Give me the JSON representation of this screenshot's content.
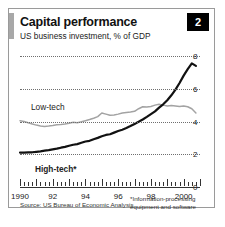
{
  "card": {
    "badge_number": "2",
    "title": "Capital performance",
    "subtitle": "US business investment, % of GDP",
    "source": "Source: US Bureau of Economic Analysis",
    "footnote_line1": "*Information-processing",
    "footnote_line2": "equipment and software"
  },
  "colors": {
    "high_tech": "#111111",
    "low_tech": "#a3a3a3",
    "grid": "#6f6f6f",
    "axis": "#333333",
    "badge_bg": "#000000",
    "accent_bar": "#a8a8a8"
  },
  "chart_data": {
    "type": "line",
    "title": "Capital performance",
    "subtitle": "US business investment, % of GDP",
    "xlabel": "",
    "ylabel": "% of GDP",
    "xlim": [
      1990,
      2001
    ],
    "ylim": [
      0,
      8
    ],
    "yticks": [
      0,
      2,
      4,
      6,
      8
    ],
    "xticks": [
      1990,
      1992,
      1994,
      1996,
      1998,
      2000
    ],
    "xticklabels": [
      "1990",
      "92",
      "94",
      "96",
      "98",
      "2000"
    ],
    "grid": "horizontal-dotted",
    "legend": "inline-labels",
    "x": [
      1990,
      1990.25,
      1990.5,
      1990.75,
      1991,
      1991.25,
      1991.5,
      1991.75,
      1992,
      1992.25,
      1992.5,
      1992.75,
      1993,
      1993.25,
      1993.5,
      1993.75,
      1994,
      1994.25,
      1994.5,
      1994.75,
      1995,
      1995.25,
      1995.5,
      1995.75,
      1996,
      1996.25,
      1996.5,
      1996.75,
      1997,
      1997.25,
      1997.5,
      1997.75,
      1998,
      1998.25,
      1998.5,
      1998.75,
      1999,
      1999.25,
      1999.5,
      1999.75,
      2000,
      2000.25,
      2000.5,
      2000.75
    ],
    "series": [
      {
        "name": "High-tech*",
        "label": "High-tech*",
        "color": "#111111",
        "note": "Information-processing equipment and software",
        "values": [
          2.1,
          2.1,
          2.12,
          2.12,
          2.15,
          2.18,
          2.22,
          2.25,
          2.3,
          2.34,
          2.4,
          2.45,
          2.52,
          2.58,
          2.62,
          2.7,
          2.78,
          2.82,
          2.92,
          3.0,
          3.1,
          3.18,
          3.22,
          3.32,
          3.42,
          3.5,
          3.6,
          3.72,
          3.85,
          3.98,
          4.12,
          4.28,
          4.45,
          4.62,
          4.85,
          5.05,
          5.3,
          5.6,
          5.95,
          6.35,
          6.8,
          7.2,
          7.55,
          7.4
        ]
      },
      {
        "name": "Low-tech",
        "label": "Low-tech",
        "color": "#a3a3a3",
        "values": [
          4.05,
          4.0,
          3.92,
          3.85,
          3.78,
          3.72,
          3.7,
          3.72,
          3.75,
          3.8,
          3.82,
          3.85,
          3.9,
          3.95,
          3.92,
          3.98,
          4.05,
          4.12,
          4.2,
          4.3,
          4.52,
          4.45,
          4.38,
          4.4,
          4.45,
          4.52,
          4.55,
          4.58,
          4.62,
          4.78,
          4.9,
          4.88,
          4.92,
          5.0,
          5.05,
          5.0,
          4.95,
          4.98,
          4.95,
          4.92,
          4.95,
          4.9,
          4.78,
          4.52
        ]
      }
    ]
  }
}
